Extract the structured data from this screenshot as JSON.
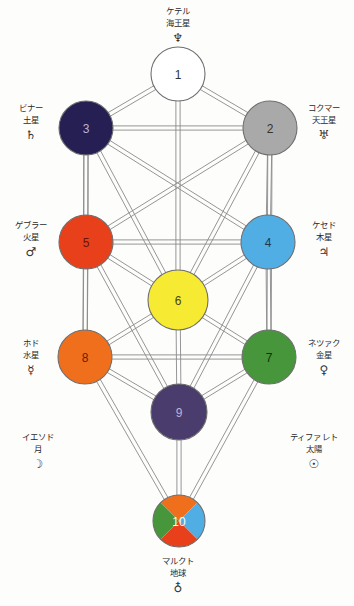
{
  "diagram": {
    "background": "#fdfdfc",
    "edge_color": "#8a8a8a"
  },
  "nodes": [
    {
      "number": "1",
      "name_ja": "ケテル",
      "planet_ja": "海王星",
      "symbol": "♆",
      "symbol_name": "neptune-symbol",
      "color": "#ffffff",
      "num_color": "#333333",
      "cx": 178,
      "cy": 74,
      "r": 27
    },
    {
      "number": "2",
      "name_ja": "コクマー",
      "planet_ja": "天王星",
      "symbol": "♅",
      "symbol_name": "uranus-symbol",
      "color": "#a9a9a9",
      "num_color": "#333333",
      "cx": 270,
      "cy": 128,
      "r": 27
    },
    {
      "number": "3",
      "name_ja": "ビナー",
      "planet_ja": "土星",
      "symbol": "♄",
      "symbol_name": "saturn-symbol",
      "color": "#261f54",
      "num_color": "#b9b2d6",
      "cx": 86,
      "cy": 128,
      "r": 27
    },
    {
      "number": "4",
      "name_ja": "ケセド",
      "planet_ja": "木星",
      "symbol": "♃",
      "symbol_name": "jupiter-symbol",
      "color": "#51aee4",
      "num_color": "#1b3a52",
      "cx": 268,
      "cy": 242,
      "r": 27
    },
    {
      "number": "5",
      "name_ja": "ゲブラー",
      "planet_ja": "火星",
      "symbol": "♂",
      "symbol_name": "mars-symbol",
      "color": "#e8401b",
      "num_color": "#6b1405",
      "cx": 86,
      "cy": 242,
      "r": 27
    },
    {
      "number": "6",
      "name_ja": "ティファレト",
      "planet_ja": "太陽",
      "symbol": "☉",
      "symbol_name": "sun-symbol",
      "color": "#f6ea32",
      "num_color": "#4a4410",
      "cx": 178,
      "cy": 300,
      "r": 30
    },
    {
      "number": "7",
      "name_ja": "ネツァク",
      "planet_ja": "金星",
      "symbol": "♀",
      "symbol_name": "venus-symbol",
      "color": "#47963c",
      "num_color": "#123008",
      "cx": 269,
      "cy": 357,
      "r": 27
    },
    {
      "number": "8",
      "name_ja": "ホド",
      "planet_ja": "水星",
      "symbol": "☿",
      "symbol_name": "mercury-symbol",
      "color": "#ef6f1c",
      "num_color": "#5a2603",
      "cx": 85,
      "cy": 357,
      "r": 27
    },
    {
      "number": "9",
      "name_ja": "イエソド",
      "planet_ja": "月",
      "symbol": "☽",
      "symbol_name": "moon-symbol",
      "color": "#4b3c6e",
      "num_color": "#bdb2d5",
      "cx": 179,
      "cy": 412,
      "r": 28
    },
    {
      "number": "10",
      "name_ja": "マルクト",
      "planet_ja": "地球",
      "symbol": "♁",
      "symbol_name": "earth-symbol",
      "color": "quadrant",
      "num_color": "#ffffff",
      "cx": 179,
      "cy": 521,
      "r": 26,
      "quadrants": {
        "top": "#ef6f1c",
        "right": "#51aee4",
        "bottom": "#e8401b",
        "left": "#47963c"
      }
    }
  ],
  "labels": [
    {
      "id": "label-kether",
      "name_ja": "ケテル",
      "planet_ja": "海王星",
      "symbol": "♆",
      "symbol_name": "neptune-symbol",
      "x": 178,
      "y": 6,
      "align": "center"
    },
    {
      "id": "label-binah",
      "name_ja": "ビナー",
      "planet_ja": "土星",
      "symbol": "♄",
      "symbol_name": "saturn-symbol",
      "x": 31,
      "y": 103,
      "align": "center"
    },
    {
      "id": "label-chokmah",
      "name_ja": "コクマー",
      "planet_ja": "天王星",
      "symbol": "♅",
      "symbol_name": "uranus-symbol",
      "x": 324,
      "y": 103,
      "align": "center"
    },
    {
      "id": "label-geburah",
      "name_ja": "ゲブラー",
      "planet_ja": "火星",
      "symbol": "♂",
      "symbol_name": "mars-symbol",
      "x": 31,
      "y": 220,
      "align": "center"
    },
    {
      "id": "label-chesed",
      "name_ja": "ケセド",
      "planet_ja": "木星",
      "symbol": "♃",
      "symbol_name": "jupiter-symbol",
      "x": 324,
      "y": 220,
      "align": "center"
    },
    {
      "id": "label-hod",
      "name_ja": "ホド",
      "planet_ja": "水星",
      "symbol": "☿",
      "symbol_name": "mercury-symbol",
      "x": 31,
      "y": 338,
      "align": "center"
    },
    {
      "id": "label-netzach",
      "name_ja": "ネツァク",
      "planet_ja": "金星",
      "symbol": "♀",
      "symbol_name": "venus-symbol",
      "x": 324,
      "y": 338,
      "align": "center"
    },
    {
      "id": "label-yesod",
      "name_ja": "イエソド",
      "planet_ja": "月",
      "symbol": "☽",
      "symbol_name": "moon-symbol",
      "x": 38,
      "y": 432,
      "align": "center"
    },
    {
      "id": "label-tiphareth",
      "name_ja": "ティファレト",
      "planet_ja": "太陽",
      "symbol": "☉",
      "symbol_name": "sun-symbol",
      "x": 314,
      "y": 432,
      "align": "center"
    },
    {
      "id": "label-malkuth",
      "name_ja": "マルクト",
      "planet_ja": "地球",
      "symbol": "♁",
      "symbol_name": "earth-symbol",
      "x": 178,
      "y": 556,
      "align": "center"
    }
  ],
  "edges": [
    [
      "1",
      "2"
    ],
    [
      "1",
      "3"
    ],
    [
      "1",
      "6"
    ],
    [
      "2",
      "3"
    ],
    [
      "2",
      "4"
    ],
    [
      "2",
      "5"
    ],
    [
      "2",
      "6"
    ],
    [
      "2",
      "7"
    ],
    [
      "3",
      "4"
    ],
    [
      "3",
      "5"
    ],
    [
      "3",
      "6"
    ],
    [
      "3",
      "8"
    ],
    [
      "4",
      "5"
    ],
    [
      "4",
      "6"
    ],
    [
      "4",
      "7"
    ],
    [
      "4",
      "9"
    ],
    [
      "5",
      "6"
    ],
    [
      "5",
      "8"
    ],
    [
      "5",
      "9"
    ],
    [
      "6",
      "7"
    ],
    [
      "6",
      "8"
    ],
    [
      "6",
      "9"
    ],
    [
      "7",
      "8"
    ],
    [
      "7",
      "9"
    ],
    [
      "7",
      "10"
    ],
    [
      "8",
      "9"
    ],
    [
      "8",
      "10"
    ],
    [
      "9",
      "10"
    ]
  ]
}
